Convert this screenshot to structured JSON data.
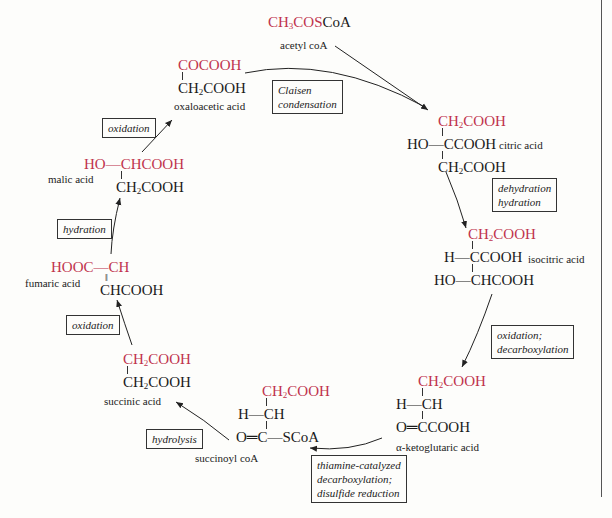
{
  "diagram": {
    "accent_color": "#c0334d",
    "compounds": {
      "acetyl_coa": {
        "formula_red": "CH3COS",
        "formula_red_parts": [
          "CH",
          "3",
          "COS"
        ],
        "formula_black": "CoA",
        "name": "acetyl coA"
      },
      "oxaloacetic": {
        "line1": "COCOOH",
        "line2_parts": [
          "CH",
          "2",
          "COOH"
        ],
        "name": "oxaloacetic acid"
      },
      "citric": {
        "line1_parts": [
          "CH",
          "2",
          "COOH"
        ],
        "line2_prefix": "HO—",
        "line2": "CCOOH",
        "line3_parts": [
          "CH",
          "2",
          "COOH"
        ],
        "name": "citric acid"
      },
      "isocitric": {
        "line1_parts": [
          "CH",
          "2",
          "COOH"
        ],
        "line2_prefix": "H—",
        "line2": "CCOOH",
        "line3_prefix": "HO—",
        "line3": "CHCOOH",
        "name": "isocitric acid"
      },
      "ketoglutaric": {
        "line1_parts": [
          "CH",
          "2",
          "COOH"
        ],
        "line2_prefix": "H—",
        "line2": "CH",
        "line3_prefix": "O═",
        "line3": "CCOOH",
        "name": "α-ketoglutaric acid"
      },
      "succinoyl_coa": {
        "line1_parts": [
          "CH",
          "2",
          "COOH"
        ],
        "line2_prefix": "H—",
        "line2": "CH",
        "line3_prefix": "O═",
        "line3": "C",
        "line3_suffix": "—SCoA",
        "name": "succinoyl coA"
      },
      "succinic": {
        "line1_parts": [
          "CH",
          "2",
          "COOH"
        ],
        "line2_parts": [
          "CH",
          "2",
          "COOH"
        ],
        "name": "succinic acid"
      },
      "fumaric": {
        "line1_red": "HOOC—CH",
        "line2": "CHCOOH",
        "name": "fumaric acid"
      },
      "malic": {
        "line1_red": "HO—CHCOOH",
        "line2_parts": [
          "CH",
          "2",
          "COOH"
        ],
        "name": "malic acid"
      }
    },
    "reactions": [
      {
        "id": "claisen",
        "lines": [
          "Claisen",
          "condensation"
        ]
      },
      {
        "id": "dehydration-hydration",
        "lines": [
          "dehydration",
          "hydration"
        ]
      },
      {
        "id": "oxidation-decarboxylation",
        "lines": [
          "oxidation;",
          "decarboxylation"
        ]
      },
      {
        "id": "thiamine",
        "lines": [
          "thiamine-catalyzed",
          "decarboxylation;",
          "disulfide reduction"
        ]
      },
      {
        "id": "hydrolysis",
        "lines": [
          "hydrolysis"
        ]
      },
      {
        "id": "oxidation-1",
        "lines": [
          "oxidation"
        ]
      },
      {
        "id": "hydration",
        "lines": [
          "hydration"
        ]
      },
      {
        "id": "oxidation-2",
        "lines": [
          "oxidation"
        ]
      }
    ]
  }
}
